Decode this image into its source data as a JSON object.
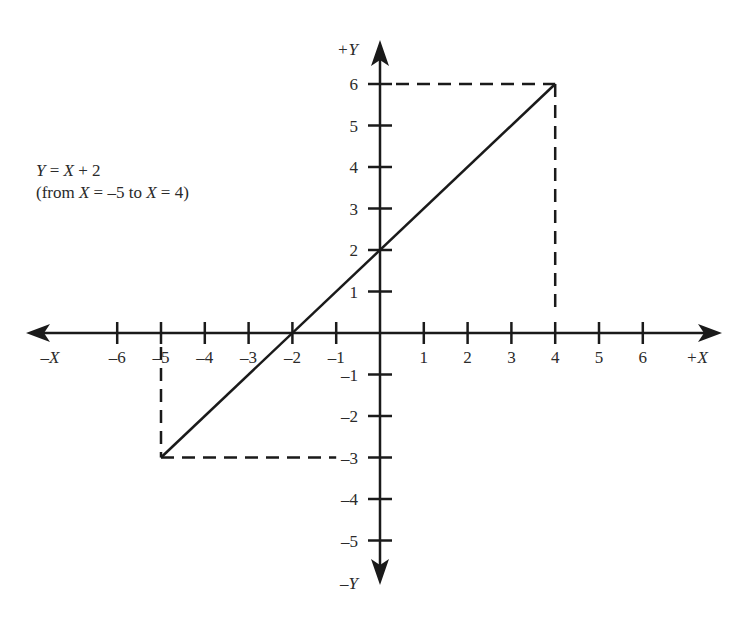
{
  "chart_data": {
    "type": "line",
    "title": "Y = X + 2",
    "subtitle": "(from X = –5 to X = 4)",
    "equation": "Y = X + 2",
    "domain_note": {
      "prefix": "(from ",
      "x1": "X",
      "mid": " = –5 to ",
      "x2": "X",
      "suffix": " = 4)"
    },
    "xlabel_pos": "+X",
    "xlabel_neg": "–X",
    "ylabel_pos": "+Y",
    "ylabel_neg": "–Y",
    "xlim": [
      -6,
      6
    ],
    "ylim": [
      -5,
      6
    ],
    "x_ticks": [
      -6,
      -5,
      -4,
      -3,
      -2,
      -1,
      1,
      2,
      3,
      4,
      5,
      6
    ],
    "y_ticks": [
      -5,
      -4,
      -3,
      -2,
      -1,
      1,
      2,
      3,
      4,
      5,
      6
    ],
    "x_tick_labels": [
      "–6",
      "–5",
      "–4",
      "–3",
      "–2",
      "–1",
      "1",
      "2",
      "3",
      "4",
      "5",
      "6"
    ],
    "y_tick_labels": [
      "–5",
      "–4",
      "–3",
      "–2",
      "–1",
      "1",
      "2",
      "3",
      "4",
      "5",
      "6"
    ],
    "series": [
      {
        "name": "Y = X + 2",
        "x": [
          -5,
          4
        ],
        "y": [
          -3,
          6
        ],
        "style": "solid"
      }
    ],
    "guides": [
      {
        "from": [
          -5,
          0
        ],
        "to": [
          -5,
          -3
        ],
        "style": "dashed"
      },
      {
        "from": [
          -5,
          -3
        ],
        "to": [
          -1,
          -3
        ],
        "style": "dashed"
      },
      {
        "from": [
          0,
          6
        ],
        "to": [
          4,
          6
        ],
        "style": "dashed"
      },
      {
        "from": [
          4,
          6
        ],
        "to": [
          4,
          0.5
        ],
        "style": "dashed"
      }
    ],
    "grid": false,
    "legend": "none"
  }
}
